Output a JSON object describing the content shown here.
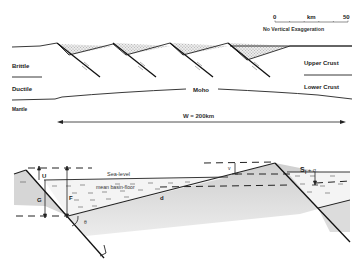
{
  "colors": {
    "ink": "#222222",
    "fill_gray": "#d4d4d4",
    "stipple": "#bdbdbd"
  },
  "scale_bar": {
    "start": "0",
    "unit": "km",
    "end": "50",
    "note": "No Vertical Exaggeration"
  },
  "crust_section": {
    "left_labels": [
      "Brittle",
      "Ductile",
      "Mantle"
    ],
    "right_labels": [
      "Upper Crust",
      "Lower Crust"
    ],
    "moho_label": "Moho",
    "width_label": "W = 200km",
    "fault_count": 4
  },
  "basin_detail": {
    "sea_level_label": "Sea-level",
    "basin_floor_label": "mean basin-floor",
    "symbols": {
      "U": "U",
      "G": "G",
      "F": "F",
      "theta": "θ",
      "d": "d",
      "v": "v",
      "S_label_main": "S",
      "S_label_sub": "l",
      "S_label_tail": " + σ"
    }
  }
}
